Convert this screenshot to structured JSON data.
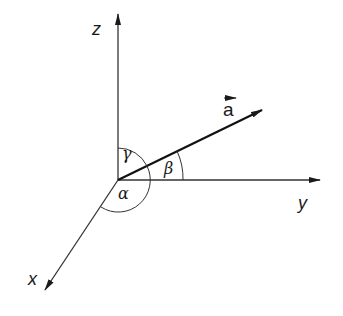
{
  "diagram": {
    "type": "3d-coordinate-axes-with-vector-direction-angles",
    "axes": {
      "z": {
        "label": "z"
      },
      "y": {
        "label": "y"
      },
      "x": {
        "label": "x"
      }
    },
    "vector": {
      "label": "a",
      "has_arrow_over_label": true
    },
    "angles": {
      "alpha": {
        "symbol": "α",
        "between": [
          "a",
          "x"
        ]
      },
      "beta": {
        "symbol": "β",
        "between": [
          "a",
          "y"
        ]
      },
      "gamma": {
        "symbol": "γ",
        "between": [
          "a",
          "z"
        ]
      }
    },
    "colors": {
      "stroke": "#1a1a1a",
      "background": "#ffffff"
    }
  }
}
